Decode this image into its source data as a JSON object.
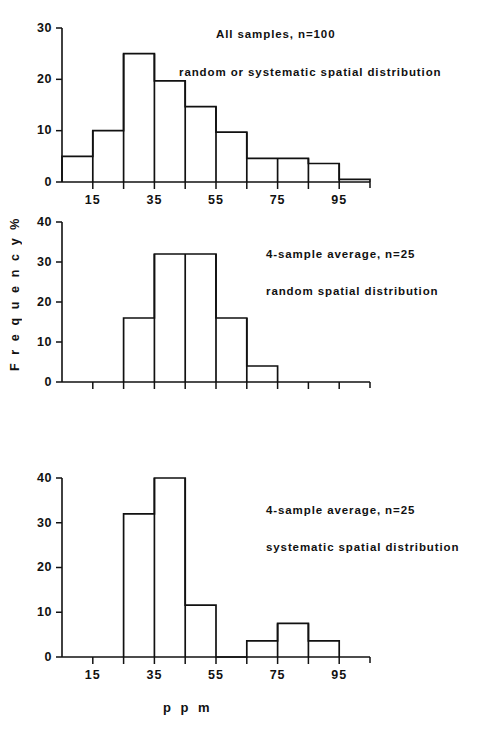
{
  "figure": {
    "ylabel": "F r e q u e n c y   %",
    "xlabel": "p p m"
  },
  "chart_data": [
    {
      "type": "bar",
      "panel": "top",
      "title": "",
      "annotations": [
        "All samples, n=100",
        "random or systematic spatial distribution"
      ],
      "xlabel": "ppm",
      "ylabel": "Frequency %",
      "categories": [
        "5-15",
        "15-25",
        "25-35",
        "35-45",
        "45-55",
        "55-65",
        "65-75",
        "75-85",
        "85-95",
        "95-105"
      ],
      "bin_edges": [
        5,
        15,
        25,
        35,
        45,
        55,
        65,
        75,
        85,
        95,
        105
      ],
      "values": [
        5,
        10,
        25,
        19.7,
        14.7,
        9.7,
        4.6,
        4.6,
        3.6,
        0.5
      ],
      "xlim": [
        5,
        105
      ],
      "ylim": [
        0,
        30
      ],
      "yticks": [
        0,
        10,
        20,
        30
      ],
      "ytick_labels": [
        "0",
        "10",
        "20",
        "30"
      ],
      "xticks": [
        15,
        25,
        35,
        45,
        55,
        65,
        75,
        85,
        95
      ],
      "xtick_labels": [
        "15",
        "",
        "35",
        "",
        "55",
        "",
        "75",
        "",
        "95"
      ],
      "grid": false,
      "legend": "none"
    },
    {
      "type": "bar",
      "panel": "middle",
      "title": "",
      "annotations": [
        "4-sample average, n=25",
        "random spatial distribution"
      ],
      "xlabel": "ppm",
      "ylabel": "Frequency %",
      "categories": [
        "25-35",
        "35-45",
        "45-55",
        "55-65",
        "65-75"
      ],
      "bin_edges": [
        25,
        35,
        45,
        55,
        65,
        75
      ],
      "values": [
        16,
        32,
        32,
        16,
        4
      ],
      "xlim": [
        5,
        105
      ],
      "ylim": [
        0,
        40
      ],
      "yticks": [
        0,
        10,
        20,
        30,
        40
      ],
      "ytick_labels": [
        "0",
        "10",
        "20",
        "30",
        "40"
      ],
      "xticks": [
        15,
        25,
        35,
        45,
        55,
        65,
        75,
        85,
        95
      ],
      "xtick_labels": [
        "",
        "",
        "",
        "",
        "",
        "",
        "",
        "",
        ""
      ],
      "grid": false,
      "legend": "none"
    },
    {
      "type": "bar",
      "panel": "bottom",
      "title": "",
      "annotations": [
        "4-sample average, n=25",
        "systematic spatial distribution"
      ],
      "xlabel": "ppm",
      "ylabel": "Frequency %",
      "categories": [
        "25-35",
        "35-45",
        "45-55",
        "65-75",
        "75-85",
        "85-95"
      ],
      "bin_edges": [
        25,
        35,
        45,
        55,
        65,
        75,
        85,
        95
      ],
      "values": [
        32,
        40,
        11.6,
        0,
        3.6,
        7.5,
        3.6
      ],
      "xlim": [
        5,
        105
      ],
      "ylim": [
        0,
        40
      ],
      "yticks": [
        0,
        10,
        20,
        30,
        40
      ],
      "ytick_labels": [
        "0",
        "10",
        "20",
        "30",
        "40"
      ],
      "xticks": [
        15,
        25,
        35,
        45,
        55,
        65,
        75,
        85,
        95
      ],
      "xtick_labels": [
        "15",
        "",
        "35",
        "",
        "55",
        "",
        "75",
        "",
        "95"
      ],
      "grid": false,
      "legend": "none"
    }
  ]
}
